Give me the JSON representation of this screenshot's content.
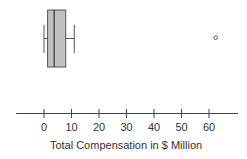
{
  "chart_data": {
    "type": "boxplot",
    "orientation": "horizontal",
    "title": "",
    "xlabel": "Total Compensation in $ Million",
    "ylabel": "",
    "xlim": [
      -10,
      70
    ],
    "xticks": [
      0,
      10,
      20,
      30,
      40,
      50,
      60
    ],
    "tick_labels": [
      "0",
      "10",
      "20",
      "30",
      "40",
      "50",
      "60"
    ],
    "grid": false,
    "legend": null,
    "box": {
      "whisker_low": 0,
      "q1": 1.3,
      "median": 3.7,
      "q3": 7.9,
      "whisker_high": 11,
      "outliers": [
        62.4
      ]
    },
    "colors": {
      "box_fill": "#c0c0c0",
      "stroke": "#555555",
      "axis": "#444444",
      "text": "#333333"
    }
  }
}
